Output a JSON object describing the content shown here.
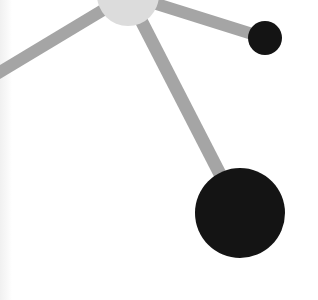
{
  "diagram": {
    "type": "node-link",
    "colors": {
      "background": "#ffffff",
      "left_strip": "#f2f2f2",
      "edge": "#a5a5a5",
      "hub_node": "#dcdcdc",
      "leaf_node": "#141414"
    },
    "nodes": [
      {
        "id": "hub",
        "cx": 128,
        "cy": -5,
        "r": 31,
        "color": "#dcdcdc"
      },
      {
        "id": "small-dark",
        "cx": 265,
        "cy": 38,
        "r": 17,
        "color": "#141414"
      },
      {
        "id": "large-dark",
        "cx": 240,
        "cy": 213,
        "r": 45,
        "color": "#141414"
      }
    ],
    "edges": [
      {
        "from": "hub",
        "to": "offscreen-left",
        "x1": 128,
        "y1": -5,
        "x2": -10,
        "y2": 78,
        "width": 12
      },
      {
        "from": "hub",
        "to": "small-dark",
        "x1": 128,
        "y1": -5,
        "x2": 265,
        "y2": 38,
        "width": 12
      },
      {
        "from": "hub",
        "to": "large-dark",
        "x1": 128,
        "y1": -5,
        "x2": 240,
        "y2": 213,
        "width": 13
      }
    ]
  }
}
